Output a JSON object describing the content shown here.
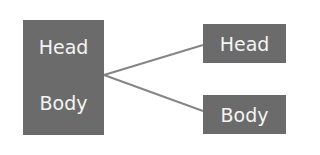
{
  "diagram": {
    "source": {
      "head": "Head",
      "body": "Body"
    },
    "targets": [
      {
        "label": "Head"
      },
      {
        "label": "Body"
      }
    ],
    "colors": {
      "box": "#6b6b6b",
      "text": "#f4f4f4",
      "line": "#808080"
    }
  }
}
